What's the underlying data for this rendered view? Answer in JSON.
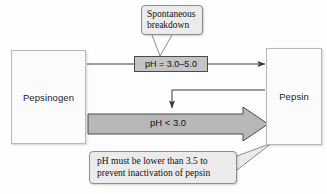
{
  "diagram": {
    "nodes": [
      {
        "id": "pepsinogen",
        "label": "Pepsinogen"
      },
      {
        "id": "pepsin",
        "label": "Pepsin"
      }
    ],
    "ph_chip": {
      "label": "pH = 3.0–5.0"
    },
    "block_arrow": {
      "label": "pH < 3.0"
    },
    "callouts": [
      {
        "id": "spontaneous",
        "line1": "Spontaneous",
        "line2": "breakdown"
      },
      {
        "id": "ph-rule",
        "line1": "pH must be lower than 3.5 to",
        "line2": "prevent inactivation of pepsin"
      }
    ],
    "colors": {
      "background": "#fdfdfd",
      "box_fill": "#fbfbfb",
      "box_stroke": "#b9b9b9",
      "chip_fill": "#c4c4c4",
      "chip_stroke": "#4a4a4a",
      "block_arrow_fill": "#b8b8b8",
      "block_arrow_stroke": "#4a4a4a",
      "callout_fill": "#ebebeb",
      "callout_stroke": "#8d8d8d",
      "connector": "#3a3a3a",
      "text": "#111111"
    }
  }
}
